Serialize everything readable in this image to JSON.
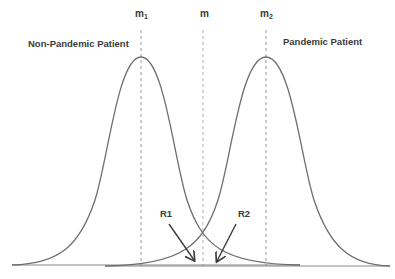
{
  "diagram": {
    "title": "",
    "mean_labels": {
      "m1": {
        "base": "m",
        "sub": "1"
      },
      "m": {
        "base": "m",
        "sub": ""
      },
      "m2": {
        "base": "m",
        "sub": "2"
      }
    },
    "distributions": [
      {
        "name": "Non-Pandemic Patient",
        "mean_label": "m1"
      },
      {
        "name": "Pandemic Patient",
        "mean_label": "m2"
      }
    ],
    "region_labels": [
      "R1",
      "R2"
    ],
    "colors": {
      "curve": "#6e6e6e",
      "dashed_line": "#9a9a9a",
      "arrow": "#3c3c3c",
      "text": "#3a3a3a",
      "baseline": "#7a7a7a"
    }
  }
}
